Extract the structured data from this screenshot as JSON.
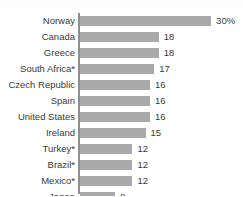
{
  "chart_data": {
    "type": "bar",
    "orientation": "horizontal",
    "title": "",
    "subtitle": "",
    "xlabel": "",
    "ylabel": "",
    "grid": false,
    "legend": null,
    "axis_visible": true,
    "xlim": [
      0,
      30
    ],
    "categories": [
      "Norway",
      "Canada",
      "Greece",
      "South Africa*",
      "Czech Republic",
      "Spain",
      "United States",
      "Ireland",
      "Turkey*",
      "Brazil*",
      "Mexico*",
      "Japan"
    ],
    "values": [
      30,
      18,
      18,
      17,
      16,
      16,
      16,
      15,
      12,
      12,
      12,
      8
    ],
    "data_labels": [
      "30%",
      "18",
      "18",
      "17",
      "16",
      "16",
      "16",
      "15",
      "12",
      "12",
      "12",
      "8"
    ],
    "bars": [
      {
        "label": "Norway",
        "value": 30,
        "display": "30%"
      },
      {
        "label": "Canada",
        "value": 18,
        "display": "18"
      },
      {
        "label": "Greece",
        "value": 18,
        "display": "18"
      },
      {
        "label": "South Africa*",
        "value": 17,
        "display": "17"
      },
      {
        "label": "Czech Republic",
        "value": 16,
        "display": "16"
      },
      {
        "label": "Spain",
        "value": 16,
        "display": "16"
      },
      {
        "label": "United States",
        "value": 16,
        "display": "16"
      },
      {
        "label": "Ireland",
        "value": 15,
        "display": "15"
      },
      {
        "label": "Turkey*",
        "value": 12,
        "display": "12"
      },
      {
        "label": "Brazil*",
        "value": 12,
        "display": "12"
      },
      {
        "label": "Mexico*",
        "value": 12,
        "display": "12"
      },
      {
        "label": "Japan",
        "value": 8,
        "display": "8"
      }
    ],
    "colors": {
      "bar": "#a9a9a9",
      "axis": "#8f8f8f",
      "text": "#3a3a3a",
      "background": "#ffffff"
    }
  }
}
